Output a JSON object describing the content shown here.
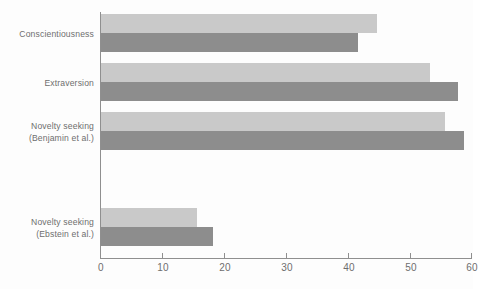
{
  "chart_data": {
    "type": "bar",
    "orientation": "horizontal",
    "title": "",
    "subtitle": "",
    "xlabel": "",
    "ylabel": "",
    "xlim": [
      0,
      60
    ],
    "xticks": [
      0,
      10,
      20,
      30,
      40,
      50,
      60
    ],
    "xtick_labels": [
      "0",
      "10",
      "20",
      "30",
      "40",
      "50",
      "60"
    ],
    "grid": false,
    "legend": "none",
    "categories": [
      "Conscientiousness",
      "Extraversion",
      "Novelty seeking (Benjamin et al.)",
      "Novelty seeking (Ebstein et al.)"
    ],
    "series": [
      {
        "name": "light",
        "color": "#c9c9c9",
        "values": [
          44.5,
          53.0,
          55.5,
          15.5
        ]
      },
      {
        "name": "dark",
        "color": "#8d8d8d",
        "values": [
          41.5,
          57.5,
          58.5,
          18.0
        ]
      }
    ]
  },
  "axis": {
    "tick_labels": [
      "0",
      "10",
      "20",
      "30",
      "40",
      "50",
      "60"
    ]
  },
  "categories": [
    {
      "line1": "Conscientiousness",
      "line2": ""
    },
    {
      "line1": "Extraversion",
      "line2": ""
    },
    {
      "line1": "Novelty seeking",
      "line2": "(Benjamin et al.)"
    },
    {
      "line1": "Novelty seeking",
      "line2": "(Ebstein et al.)"
    }
  ],
  "colors": {
    "light_bar": "#c9c9c9",
    "dark_bar": "#8d8d8d",
    "axis": "#8f8f8f",
    "text": "#6e6e6e",
    "background": "#fdfdfd"
  }
}
